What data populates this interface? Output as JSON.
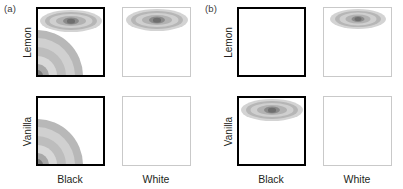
{
  "figure": {
    "width": 403,
    "height": 189,
    "background": "#ffffff",
    "style": "grayscale contour density panels"
  },
  "colors": {
    "black_edge": "#000000",
    "white_edge": "#c9c9c9",
    "text": "#231f20",
    "contour_light": "#d3d3d3",
    "contour_mid": "#b2b2b2",
    "contour_dark": "#6e6e6e"
  },
  "subfigures": [
    {
      "tag": "(a)",
      "row_labels": [
        "Lemon",
        "Vanilla"
      ],
      "col_labels": [
        "Black",
        "White"
      ],
      "cells": [
        {
          "row": "Lemon",
          "col": "Black",
          "edge": "black",
          "blobs": [
            "top-center",
            "bottom-left-corner"
          ]
        },
        {
          "row": "Lemon",
          "col": "White",
          "edge": "white",
          "blobs": [
            "top-center"
          ]
        },
        {
          "row": "Vanilla",
          "col": "Black",
          "edge": "black",
          "blobs": [
            "bottom-left-corner"
          ]
        },
        {
          "row": "Vanilla",
          "col": "White",
          "edge": "white",
          "blobs": []
        }
      ]
    },
    {
      "tag": "(b)",
      "row_labels": [
        "Lemon",
        "Vanilla"
      ],
      "col_labels": [
        "Black",
        "White"
      ],
      "cells": [
        {
          "row": "Lemon",
          "col": "Black",
          "edge": "black",
          "blobs": []
        },
        {
          "row": "Lemon",
          "col": "White",
          "edge": "white",
          "blobs": [
            "top-center"
          ]
        },
        {
          "row": "Vanilla",
          "col": "Black",
          "edge": "black",
          "blobs": [
            "top-center"
          ]
        },
        {
          "row": "Vanilla",
          "col": "White",
          "edge": "white",
          "blobs": []
        }
      ]
    }
  ],
  "chart_data": {
    "type": "heatmap",
    "title": "",
    "xlabel": "",
    "ylabel": "",
    "panels": [
      {
        "tag": "(a)",
        "rows": [
          "Lemon",
          "Vanilla"
        ],
        "cols": [
          "Black",
          "White"
        ],
        "cells": [
          {
            "row": "Lemon",
            "col": "Black",
            "regions": [
              {
                "location": "top-center",
                "shape": "ellipse",
                "peak_intensity": 1.0
              },
              {
                "location": "bottom-left",
                "shape": "quarter-circle",
                "peak_intensity": 0.85
              }
            ]
          },
          {
            "row": "Lemon",
            "col": "White",
            "regions": [
              {
                "location": "top-center",
                "shape": "ellipse",
                "peak_intensity": 1.0
              }
            ]
          },
          {
            "row": "Vanilla",
            "col": "Black",
            "regions": [
              {
                "location": "bottom-left",
                "shape": "quarter-circle",
                "peak_intensity": 0.85
              }
            ]
          },
          {
            "row": "Vanilla",
            "col": "White",
            "regions": []
          }
        ]
      },
      {
        "tag": "(b)",
        "rows": [
          "Lemon",
          "Vanilla"
        ],
        "cols": [
          "Black",
          "White"
        ],
        "cells": [
          {
            "row": "Lemon",
            "col": "Black",
            "regions": []
          },
          {
            "row": "Lemon",
            "col": "White",
            "regions": [
              {
                "location": "top-center",
                "shape": "ellipse",
                "peak_intensity": 1.0
              }
            ]
          },
          {
            "row": "Vanilla",
            "col": "Black",
            "regions": [
              {
                "location": "top-center",
                "shape": "ellipse",
                "peak_intensity": 1.0
              }
            ]
          },
          {
            "row": "Vanilla",
            "col": "White",
            "regions": []
          }
        ]
      }
    ],
    "contour_levels": [
      {
        "level": 1,
        "color": "#d3d3d3"
      },
      {
        "level": 2,
        "color": "#b6b6b6"
      },
      {
        "level": 3,
        "color": "#cfcfcf"
      },
      {
        "level": 4,
        "color": "#b2b2b2"
      },
      {
        "level": 5,
        "color": "#8a8a8a"
      },
      {
        "level": 6,
        "color": "#6e6e6e"
      }
    ],
    "grid": false,
    "legend": "none"
  }
}
